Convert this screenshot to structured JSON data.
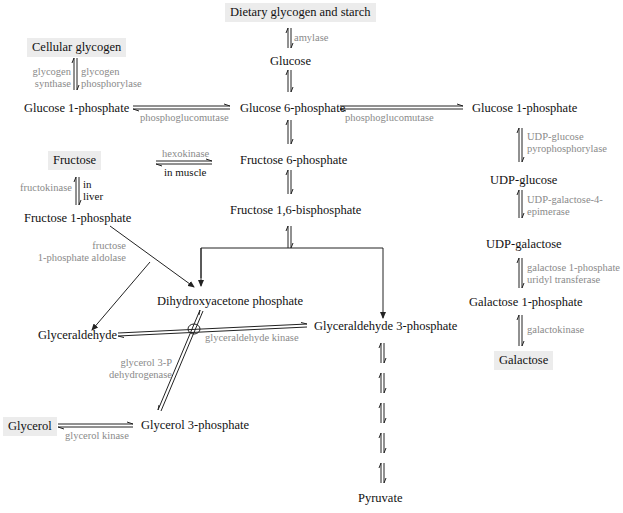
{
  "nodes": {
    "dietary": "Dietary glycogen and starch",
    "glucose": "Glucose",
    "cellular_glycogen": "Cellular glycogen",
    "g1p_left": "Glucose 1-phosphate",
    "g6p": "Glucose 6-phosphate",
    "g1p_right": "Glucose 1-phosphate",
    "fructose": "Fructose",
    "f6p": "Fructose 6-phosphate",
    "f1p": "Fructose 1-phosphate",
    "f16bp": "Fructose 1,6-bisphosphate",
    "udp_glucose": "UDP-glucose",
    "udp_galactose": "UDP-galactose",
    "dhap": "Dihydroxyacetone phosphate",
    "glyceraldehyde": "Glyceraldehyde",
    "ga3p": "Glyceraldehyde 3-phosphate",
    "galactose_1p": "Galactose 1-phosphate",
    "galactose": "Galactose",
    "glycerol": "Glycerol",
    "glycerol_3p": "Glycerol 3-phosphate",
    "pyruvate": "Pyruvate"
  },
  "enzymes": {
    "amylase": "amylase",
    "glycogen_synthase_1": "glycogen",
    "glycogen_synthase_2": "synthase",
    "glycogen_phosphorylase_1": "glycogen",
    "glycogen_phosphorylase_2": "phosphorylase",
    "phosphoglucomutase_left": "phosphoglucomutase",
    "phosphoglucomutase_right": "phosphoglucomutase",
    "hexokinase": "hexokinase",
    "in_muscle": "in muscle",
    "fructokinase": "fructokinase",
    "in_liver_1": "in",
    "in_liver_2": "liver",
    "udp_glucose_pyro_1": "UDP-glucose",
    "udp_glucose_pyro_2": "pyrophosphorylase",
    "udp_gal_epimerase_1": "UDP-galactose-4-",
    "udp_gal_epimerase_2": "epimerase",
    "f1p_aldolase_1": "fructose",
    "f1p_aldolase_2": "1-phosphate aldolase",
    "gal1p_uridyl_1": "galactose 1-phosphate",
    "gal1p_uridyl_2": "uridyl transferase",
    "glyceraldehyde_kinase": "glyceraldehyde kinase",
    "galactokinase": "galactokinase",
    "g3p_dehydrogenase_1": "glycerol 3-P",
    "g3p_dehydrogenase_2": "dehydrogenase",
    "glycerol_kinase": "glycerol kinase"
  },
  "colors": {
    "node_text": "#111111",
    "enzyme_text": "#8a8a8a",
    "box_fill": "#ececec",
    "line": "#222222"
  }
}
